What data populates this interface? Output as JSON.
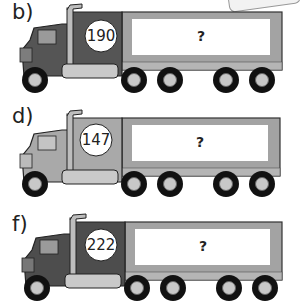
{
  "worksheet": {
    "problems": [
      {
        "label": "b)",
        "cab_number": "190",
        "trailer_value": "?",
        "cab_color": "#555555"
      },
      {
        "label": "d)",
        "cab_number": "147",
        "trailer_value": "?",
        "cab_color": "#a9a9a9"
      },
      {
        "label": "f)",
        "cab_number": "222",
        "trailer_value": "?",
        "cab_color": "#4d4d4d"
      }
    ]
  },
  "colors": {
    "trailer_frame": "#a3a3a3",
    "trailer_panel": "#ffffff",
    "tire": "#111111",
    "hub": "#c8c8c8"
  }
}
